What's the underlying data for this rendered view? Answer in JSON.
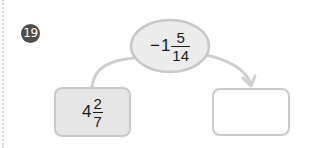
{
  "problem": {
    "number": "19",
    "badge_color": "#4d4d4d"
  },
  "operator_node": {
    "sign": "−",
    "whole": "1",
    "numerator": "5",
    "denominator": "14",
    "fill": "#ececec",
    "stroke": "#c8c8c8"
  },
  "input_box": {
    "whole": "4",
    "numerator": "2",
    "denominator": "7"
  },
  "answer_box": {
    "value": ""
  },
  "icons": {
    "arrow": "arrow-right-curved-icon",
    "connector": "curved-connector"
  }
}
